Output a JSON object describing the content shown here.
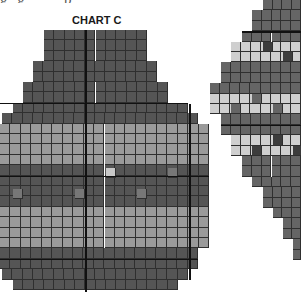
{
  "top_caption": "g  g  ·  ·  p",
  "left_chart": {
    "title": "CHART C",
    "colors": {
      "dark": "#555555",
      "light": "#9a9a9a",
      "highlight": "#c8c8c8",
      "mid": "#777777"
    },
    "cell_w": 10.4,
    "cell_h": 10.4,
    "rows": [
      {
        "y": 30,
        "x0": 44,
        "x1": 147,
        "tone": "dark"
      },
      {
        "y": 40.4,
        "x0": 44,
        "x1": 147,
        "tone": "dark"
      },
      {
        "y": 50.8,
        "x0": 44,
        "x1": 147,
        "tone": "dark"
      },
      {
        "y": 61.2,
        "x0": 33,
        "x1": 157,
        "tone": "dark"
      },
      {
        "y": 71.6,
        "x0": 33,
        "x1": 157,
        "tone": "dark"
      },
      {
        "y": 82,
        "x0": 23,
        "x1": 168,
        "tone": "dark"
      },
      {
        "y": 92.4,
        "x0": 23,
        "x1": 168,
        "tone": "dark"
      },
      {
        "y": 102.8,
        "x0": 13,
        "x1": 188,
        "tone": "dark"
      },
      {
        "y": 113.2,
        "x0": 2,
        "x1": 198,
        "tone": "dark"
      },
      {
        "y": 123.6,
        "x0": 0,
        "x1": 209,
        "tone": "light"
      },
      {
        "y": 134,
        "x0": 0,
        "x1": 209,
        "tone": "light"
      },
      {
        "y": 144.4,
        "x0": 0,
        "x1": 209,
        "tone": "light"
      },
      {
        "y": 154.8,
        "x0": 0,
        "x1": 209,
        "tone": "light"
      },
      {
        "y": 165.2,
        "x0": 0,
        "x1": 209,
        "tone": "dark"
      },
      {
        "y": 175.6,
        "x0": 0,
        "x1": 209,
        "tone": "dark"
      },
      {
        "y": 186,
        "x0": 0,
        "x1": 209,
        "tone": "dark"
      },
      {
        "y": 196.4,
        "x0": 0,
        "x1": 209,
        "tone": "dark"
      },
      {
        "y": 206.8,
        "x0": 0,
        "x1": 209,
        "tone": "light"
      },
      {
        "y": 217.2,
        "x0": 0,
        "x1": 209,
        "tone": "light"
      },
      {
        "y": 227.6,
        "x0": 0,
        "x1": 209,
        "tone": "light"
      },
      {
        "y": 238,
        "x0": 0,
        "x1": 209,
        "tone": "light"
      },
      {
        "y": 248.4,
        "x0": 0,
        "x1": 198,
        "tone": "dark"
      },
      {
        "y": 258.8,
        "x0": 0,
        "x1": 198,
        "tone": "dark"
      },
      {
        "y": 269.2,
        "x0": 2,
        "x1": 188,
        "tone": "dark"
      },
      {
        "y": 279.6,
        "x0": 13,
        "x1": 178,
        "tone": "dark"
      }
    ],
    "special_cells": [
      {
        "x": 106,
        "y": 168,
        "tone": "highlight"
      },
      {
        "x": 168,
        "y": 168,
        "tone": "mid"
      },
      {
        "x": 13,
        "y": 189,
        "tone": "mid"
      },
      {
        "x": 75,
        "y": 189,
        "tone": "mid"
      },
      {
        "x": 137,
        "y": 189,
        "tone": "mid"
      }
    ],
    "dividers": [
      {
        "type": "v",
        "x": 85,
        "y0": 30,
        "y1": 292
      },
      {
        "type": "v",
        "x": 189,
        "y0": 104,
        "y1": 280
      },
      {
        "type": "h",
        "y": 102.5,
        "x0": 0,
        "x1": 188
      },
      {
        "type": "h",
        "y": 175.5,
        "x0": 0,
        "x1": 209
      },
      {
        "type": "h",
        "y": 258.5,
        "x0": 0,
        "x1": 198
      }
    ]
  },
  "right_chart": {
    "colors": {
      "dark": "#656565",
      "light": "#cfcfcf",
      "darkcell": "#3c3c3c"
    },
    "cell_w": 10.4,
    "cell_h": 10.4,
    "rows": [
      {
        "y": 0,
        "x0": 263,
        "x1": 301,
        "tone": "dark"
      },
      {
        "y": 10.4,
        "x0": 252,
        "x1": 301,
        "tone": "dark"
      },
      {
        "y": 20.8,
        "x0": 252,
        "x1": 301,
        "tone": "dark"
      },
      {
        "y": 31.2,
        "x0": 242,
        "x1": 301,
        "tone": "dark"
      },
      {
        "y": 41.6,
        "x0": 231,
        "x1": 301,
        "tone": "light"
      },
      {
        "y": 52,
        "x0": 231,
        "x1": 301,
        "tone": "light"
      },
      {
        "y": 62.4,
        "x0": 221,
        "x1": 301,
        "tone": "dark"
      },
      {
        "y": 72.8,
        "x0": 221,
        "x1": 301,
        "tone": "dark"
      },
      {
        "y": 83.2,
        "x0": 210,
        "x1": 301,
        "tone": "dark"
      },
      {
        "y": 93.6,
        "x0": 210,
        "x1": 301,
        "tone": "light"
      },
      {
        "y": 104,
        "x0": 210,
        "x1": 301,
        "tone": "light"
      },
      {
        "y": 114.4,
        "x0": 221,
        "x1": 301,
        "tone": "dark"
      },
      {
        "y": 124.8,
        "x0": 221,
        "x1": 301,
        "tone": "dark"
      },
      {
        "y": 135.2,
        "x0": 231,
        "x1": 301,
        "tone": "light"
      },
      {
        "y": 145.6,
        "x0": 231,
        "x1": 301,
        "tone": "light"
      },
      {
        "y": 156,
        "x0": 242,
        "x1": 301,
        "tone": "dark"
      },
      {
        "y": 166.4,
        "x0": 242,
        "x1": 301,
        "tone": "dark"
      },
      {
        "y": 176.8,
        "x0": 252,
        "x1": 301,
        "tone": "dark"
      },
      {
        "y": 187.2,
        "x0": 263,
        "x1": 301,
        "tone": "dark"
      },
      {
        "y": 197.6,
        "x0": 263,
        "x1": 301,
        "tone": "dark"
      },
      {
        "y": 208,
        "x0": 273,
        "x1": 301,
        "tone": "dark"
      },
      {
        "y": 218.4,
        "x0": 283,
        "x1": 301,
        "tone": "dark"
      },
      {
        "y": 228.8,
        "x0": 283,
        "x1": 301,
        "tone": "dark"
      },
      {
        "y": 239.2,
        "x0": 293,
        "x1": 301,
        "tone": "dark"
      },
      {
        "y": 249.6,
        "x0": 293,
        "x1": 301,
        "tone": "dark"
      }
    ],
    "special_cells": [
      {
        "x": 263,
        "y": 41.6,
        "tone": "darkcell"
      },
      {
        "x": 283,
        "y": 52,
        "tone": "darkcell"
      },
      {
        "x": 252,
        "y": 93.6,
        "tone": "dark"
      },
      {
        "x": 231,
        "y": 104,
        "tone": "dark"
      },
      {
        "x": 273,
        "y": 104,
        "tone": "dark"
      },
      {
        "x": 273,
        "y": 135.2,
        "tone": "darkcell"
      },
      {
        "x": 252,
        "y": 145.6,
        "tone": "darkcell"
      },
      {
        "x": 293,
        "y": 145.6,
        "tone": "darkcell"
      }
    ],
    "dividers": [
      {
        "type": "h",
        "y": 31,
        "x0": 242,
        "x1": 301
      },
      {
        "type": "h",
        "y": 124.5,
        "x0": 221,
        "x1": 301
      }
    ]
  }
}
